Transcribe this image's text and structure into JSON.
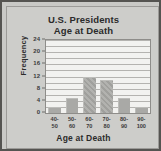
{
  "chart_data": {
    "type": "bar",
    "title": "U.S. Presidents Age at Death",
    "title_line1": "U.S. Presidents",
    "title_line2": "Age at Death",
    "xlabel": "Age at Death",
    "ylabel": "Frequency",
    "categories": [
      "40-\n50",
      "50-\n60",
      "60-\n70",
      "70-\n80",
      "80-\n90",
      "90-\n100"
    ],
    "bins": [
      {
        "lower": "40-",
        "upper": "50",
        "value": 2
      },
      {
        "lower": "50-",
        "upper": "60",
        "value": 5
      },
      {
        "lower": "60-",
        "upper": "70",
        "value": 12
      },
      {
        "lower": "70-",
        "upper": "80",
        "value": 11
      },
      {
        "lower": "80-",
        "upper": "90",
        "value": 5
      },
      {
        "lower": "90-",
        "upper": "100",
        "value": 2
      }
    ],
    "values": [
      2,
      5,
      12,
      11,
      5,
      2
    ],
    "ylim": [
      0,
      24
    ],
    "ytick_values": [
      0,
      4,
      8,
      12,
      16,
      20,
      24
    ],
    "ytick_labels": [
      "0",
      "4",
      "8",
      "12",
      "16",
      "20",
      "24"
    ],
    "gridlines": [
      2,
      4,
      6,
      8,
      10,
      12,
      14,
      16,
      18,
      20,
      22,
      24
    ],
    "grid": true,
    "legend": "none",
    "colors": {
      "bar": "#a9a9a6",
      "plot_background": "#f2f2f0",
      "page_background": "#c9c9c6",
      "border": "#555451",
      "gridline": "#b4b3b0",
      "text": "#2b2b2b"
    }
  }
}
